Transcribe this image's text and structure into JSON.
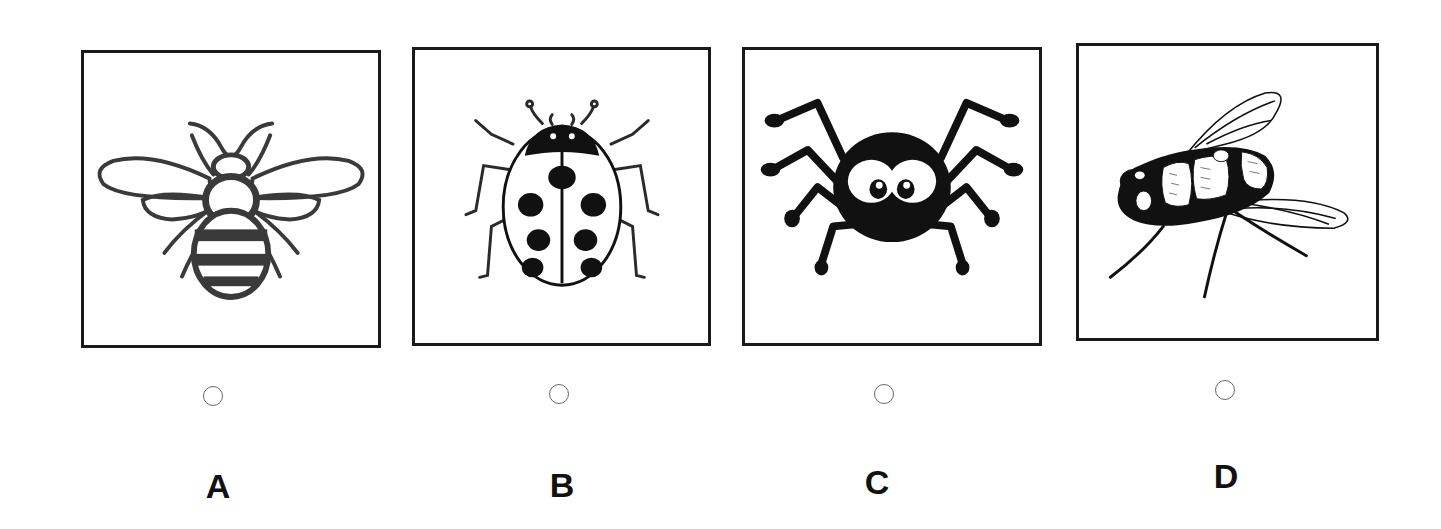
{
  "question": {
    "options": [
      {
        "letter": "A",
        "subject": "bee",
        "icon": "bee-icon",
        "selected": false
      },
      {
        "letter": "B",
        "subject": "ladybug",
        "icon": "ladybug-icon",
        "selected": false
      },
      {
        "letter": "C",
        "subject": "spider",
        "icon": "spider-icon",
        "selected": false
      },
      {
        "letter": "D",
        "subject": "fly",
        "icon": "fly-icon",
        "selected": false
      }
    ]
  },
  "colors": {
    "ink": "#1a1a1a",
    "radio_border": "#6a6a6a",
    "background": "#ffffff"
  }
}
